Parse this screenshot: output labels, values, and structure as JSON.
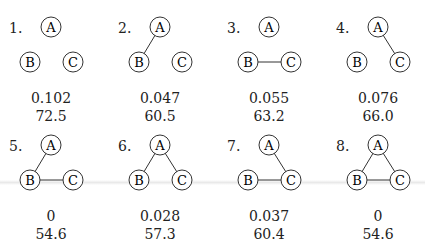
{
  "node_labels": {
    "a": "A",
    "b": "B",
    "c": "C"
  },
  "panels": [
    {
      "number": "1.",
      "edges": [],
      "value1": "0.102",
      "value2": "72.5"
    },
    {
      "number": "2.",
      "edges": [
        "AB"
      ],
      "value1": "0.047",
      "value2": "60.5"
    },
    {
      "number": "3.",
      "edges": [
        "BC"
      ],
      "value1": "0.055",
      "value2": "63.2"
    },
    {
      "number": "4.",
      "edges": [
        "AC"
      ],
      "value1": "0.076",
      "value2": "66.0"
    },
    {
      "number": "5.",
      "edges": [
        "AB",
        "BC"
      ],
      "value1": "0",
      "value2": "54.6"
    },
    {
      "number": "6.",
      "edges": [
        "AB",
        "AC"
      ],
      "value1": "0.028",
      "value2": "57.3"
    },
    {
      "number": "7.",
      "edges": [
        "AC",
        "BC"
      ],
      "value1": "0.037",
      "value2": "60.4"
    },
    {
      "number": "8.",
      "edges": [
        "AB",
        "AC",
        "BC"
      ],
      "value1": "0",
      "value2": "54.6"
    }
  ]
}
